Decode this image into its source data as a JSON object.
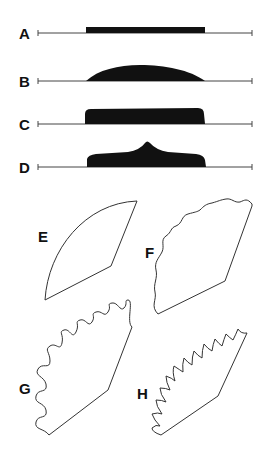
{
  "figure": {
    "colors": {
      "ink": "#111111",
      "line": "#444444",
      "background": "#ffffff"
    },
    "profiles": [
      {
        "label": "A",
        "shape": "flat-rectangle"
      },
      {
        "label": "B",
        "shape": "dome"
      },
      {
        "label": "C",
        "shape": "rounded-rectangle"
      },
      {
        "label": "D",
        "shape": "central-cusp"
      }
    ],
    "sectors": [
      {
        "label": "E",
        "edge": "smooth-arc"
      },
      {
        "label": "F",
        "edge": "gently-wavy-arc"
      },
      {
        "label": "G",
        "edge": "strongly-undulating-arc"
      },
      {
        "label": "H",
        "edge": "cusped-arc"
      }
    ]
  }
}
